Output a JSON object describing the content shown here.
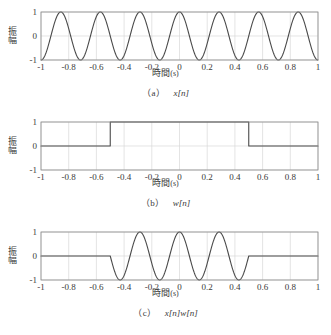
{
  "figure": {
    "panel_count": 3
  },
  "axis": {
    "xlabel_text": "時間",
    "xlabel_unit": "(s)",
    "ylabel_text": "振幅",
    "xticks": [
      "-1",
      "-0.8",
      "-0.6",
      "-0.4",
      "-0.2",
      "0",
      "0.2",
      "0.4",
      "0.6",
      "0.8",
      "1"
    ],
    "xtick_values": [
      -1,
      -0.8,
      -0.6,
      -0.4,
      -0.2,
      0,
      0.2,
      0.4,
      0.6,
      0.8,
      1
    ],
    "yticks": [
      "-1",
      "0",
      "1"
    ],
    "ytick_values": [
      -1,
      0,
      1
    ],
    "xlim": [
      -1,
      1
    ],
    "ylim": [
      -1,
      1
    ],
    "grid": true,
    "line_color": "#4a4a4a",
    "grid_color": "#d8d8d8",
    "frame_color": "#8a8a8a",
    "background": "#ffffff"
  },
  "panels": [
    {
      "id": "a",
      "caption_id": "（a）",
      "caption_expr": "x[n]",
      "chart_data": {
        "type": "line",
        "title": "x[n]",
        "xlabel": "時間(s)",
        "ylabel": "振幅",
        "xlim": [
          -1,
          1
        ],
        "ylim": [
          -1,
          1
        ],
        "grid": true,
        "legend": "none",
        "signal": "cosine",
        "frequency_hz": 3.5,
        "amplitude": 1,
        "peaks_x": [
          -0.857,
          -0.571,
          -0.286,
          0,
          0.286,
          0.571,
          0.857
        ],
        "troughs_x": [
          -1,
          -0.714,
          -0.429,
          -0.143,
          0.143,
          0.429,
          0.714,
          1
        ],
        "x": [
          -1,
          -0.95,
          -0.9,
          -0.85,
          -0.8,
          -0.75,
          -0.7,
          -0.65,
          -0.6,
          -0.55,
          -0.5,
          -0.45,
          -0.4,
          -0.35,
          -0.3,
          -0.25,
          -0.2,
          -0.15,
          -0.1,
          -0.05,
          0,
          0.05,
          0.1,
          0.15,
          0.2,
          0.25,
          0.3,
          0.35,
          0.4,
          0.45,
          0.5,
          0.55,
          0.6,
          0.65,
          0.7,
          0.75,
          0.8,
          0.85,
          0.9,
          0.95,
          1
        ],
        "values": [
          -1,
          -0.434,
          0.434,
          1,
          0.434,
          -0.434,
          -1,
          -0.434,
          0.434,
          1,
          0.434,
          -0.434,
          -1,
          -0.434,
          0.434,
          1,
          0.434,
          -0.434,
          -1,
          -0.434,
          1,
          -0.434,
          -1,
          -0.434,
          0.434,
          1,
          0.434,
          -0.434,
          -1,
          -0.434,
          0.434,
          1,
          0.434,
          -0.434,
          -1,
          -0.434,
          0.434,
          1,
          0.434,
          -0.434,
          -1
        ]
      }
    },
    {
      "id": "b",
      "caption_id": "（b）",
      "caption_expr": "w[n]",
      "chart_data": {
        "type": "line",
        "title": "w[n]",
        "xlabel": "時間(s)",
        "ylabel": "振幅",
        "xlim": [
          -1,
          1
        ],
        "ylim": [
          -1,
          1
        ],
        "grid": true,
        "legend": "none",
        "signal": "rectangular-window",
        "window_start": -0.5,
        "window_end": 0.5,
        "window_level": 1,
        "outside_level": 0,
        "x": [
          -1,
          -0.5,
          -0.5,
          0.5,
          0.5,
          1
        ],
        "values": [
          0,
          0,
          1,
          1,
          0,
          0
        ]
      }
    },
    {
      "id": "c",
      "caption_id": "（c）",
      "caption_expr": "x[n]w[n]",
      "chart_data": {
        "type": "line",
        "title": "x[n]w[n]",
        "xlabel": "時間(s)",
        "ylabel": "振幅",
        "xlim": [
          -1,
          1
        ],
        "ylim": [
          -1,
          1
        ],
        "grid": true,
        "legend": "none",
        "signal": "windowed-cosine",
        "frequency_hz": 3.5,
        "window_start": -0.5,
        "window_end": 0.5,
        "peaks_x": [
          -0.286,
          0,
          0.286
        ],
        "troughs_x": [
          -0.429,
          -0.143,
          0.143,
          0.429
        ],
        "x": [
          -1,
          -0.8,
          -0.6,
          -0.5,
          -0.45,
          -0.4,
          -0.35,
          -0.3,
          -0.25,
          -0.2,
          -0.15,
          -0.1,
          -0.05,
          0,
          0.05,
          0.1,
          0.15,
          0.2,
          0.25,
          0.3,
          0.35,
          0.4,
          0.45,
          0.5,
          0.6,
          0.8,
          1
        ],
        "values": [
          0,
          0,
          0,
          0.434,
          -0.434,
          -1,
          -0.434,
          0.434,
          1,
          0.434,
          -0.434,
          -1,
          -0.434,
          1,
          -0.434,
          -1,
          -0.434,
          0.434,
          1,
          0.434,
          -0.434,
          -1,
          -0.434,
          0.434,
          0,
          0,
          0
        ]
      }
    }
  ]
}
